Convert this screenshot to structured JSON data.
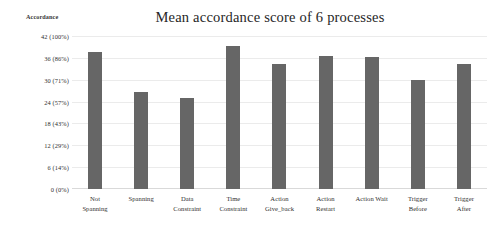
{
  "chart_data": {
    "type": "bar",
    "title": "Mean accordance score of 6 processes",
    "xlabel": "",
    "ylabel": "Accordance",
    "ylim": [
      0,
      42
    ],
    "grid": true,
    "legend": "none",
    "bar_color": "#666666",
    "background_color": "#ffffff",
    "gridline_color": "#ebebeb",
    "categories": [
      "Not Spanning",
      "Spanning",
      "Data Constraint",
      "Time Constraint",
      "Action Give_back",
      "Action Restart",
      "Action Wait",
      "Trigger Before",
      "Trigger After"
    ],
    "category_lines": [
      [
        "Not",
        "Spanning"
      ],
      [
        "Spanning",
        ""
      ],
      [
        "Data",
        "Constraint"
      ],
      [
        "Time",
        "Constraint"
      ],
      [
        "Action",
        "Give_back"
      ],
      [
        "Action",
        "Restart"
      ],
      [
        "Action Wait",
        ""
      ],
      [
        "Trigger",
        "Before"
      ],
      [
        "Trigger",
        "After"
      ]
    ],
    "values": [
      37.6,
      26.6,
      25.0,
      39.3,
      34.3,
      36.5,
      36.2,
      29.8,
      34.2
    ],
    "yticks": [
      {
        "value": 42,
        "label": "42 (100%)"
      },
      {
        "value": 36,
        "label": "36 (86%)"
      },
      {
        "value": 30,
        "label": "30 (71%)"
      },
      {
        "value": 24,
        "label": "24 (57%)"
      },
      {
        "value": 18,
        "label": "18 (43%)"
      },
      {
        "value": 12,
        "label": "12 (29%)"
      },
      {
        "value": 6,
        "label": "6 (14%)"
      },
      {
        "value": 0,
        "label": "0 (0%)"
      }
    ]
  }
}
